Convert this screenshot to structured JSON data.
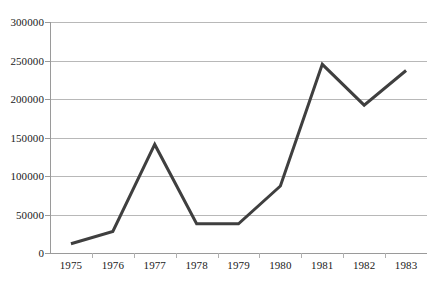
{
  "chart_data": {
    "type": "line",
    "title": "",
    "subtitle": "",
    "xlabel": "",
    "ylabel": "",
    "categories": [
      "1975",
      "1976",
      "1977",
      "1978",
      "1979",
      "1980",
      "1981",
      "1982",
      "1983"
    ],
    "series": [
      {
        "name": "",
        "values": [
          12000,
          28000,
          141000,
          38000,
          38000,
          87000,
          245000,
          192000,
          237000
        ]
      }
    ],
    "ylim": [
      0,
      300000
    ],
    "yticks": [
      0,
      50000,
      100000,
      150000,
      200000,
      250000,
      300000
    ],
    "ytick_labels": [
      "0",
      "50000",
      "100000",
      "150000",
      "200000",
      "250000",
      "300000"
    ],
    "grid": "horizontal",
    "legend": "none",
    "colors": {
      "line": "#3f3f3f",
      "gridline": "#b8b8b8",
      "axis": "#9a9a9a",
      "background": "#ffffff",
      "text": "#1a1a1a"
    },
    "line_width": 3
  }
}
